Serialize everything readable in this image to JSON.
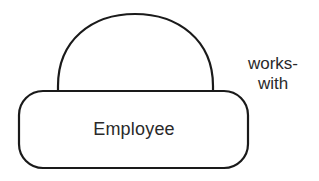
{
  "diagram": {
    "type": "entity-relationship",
    "entity": {
      "name": "Employee",
      "shape": "rounded-rectangle"
    },
    "relationship": {
      "name": "works-with",
      "label_lines": [
        "works-",
        "with"
      ],
      "shape": "semicircle",
      "kind": "recursive",
      "connects": [
        "Employee",
        "Employee"
      ]
    },
    "colors": {
      "stroke": "#1a1a1a",
      "text": "#2a2a2a",
      "background": "#ffffff"
    }
  }
}
